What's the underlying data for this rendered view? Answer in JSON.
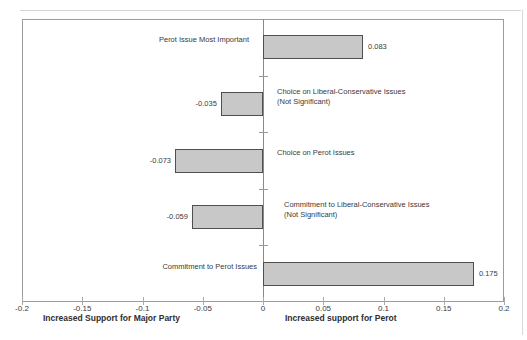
{
  "figure": {
    "background": "#ffffff",
    "frame_color": "#9c9c9c",
    "axis_color": "#8a8a8a",
    "text_color": "#3a3a3a"
  },
  "chart_data": {
    "type": "bar",
    "orientation": "horizontal",
    "categories": [
      "Perot Issue Most Important",
      "Choice on Liberal-Conservative Issues (Not Significant)",
      "Choice on Perot Issues",
      "Commitment to Liberal-Conservative Issues (Not Significant)",
      "Commitment to Perot Issues"
    ],
    "category_label_lines": [
      [
        "Perot Issue Most Important"
      ],
      [
        "Choice on Liberal-Conservative Issues",
        "(Not Significant)"
      ],
      [
        "Choice on Perot Issues"
      ],
      [
        "Commitment to Liberal-Conservative Issues",
        "(Not Significant)"
      ],
      [
        "Commitment to Perot  Issues"
      ]
    ],
    "values": [
      0.083,
      -0.035,
      -0.073,
      -0.059,
      0.175
    ],
    "value_labels": [
      "0.083",
      "-0.035",
      "-0.073",
      "-0.059",
      "0.175"
    ],
    "xlim": [
      -0.2,
      0.2
    ],
    "x_tick_values": [
      -0.2,
      -0.15,
      -0.1,
      -0.05,
      0,
      0.05,
      0.1,
      0.15,
      0.2
    ],
    "x_tick_labels": [
      "-0.2",
      "-0.15",
      "-0.1",
      "-0.05",
      "0",
      "0.05",
      "0.1",
      "0.15",
      "0.2"
    ],
    "xlabel_left": "Increased Support for Major Party",
    "xlabel_right": "Increased support for Perot",
    "bar_fill": "#c8c8c8",
    "bar_border": "#4f4f4f",
    "grid": "off",
    "legend": "none"
  }
}
